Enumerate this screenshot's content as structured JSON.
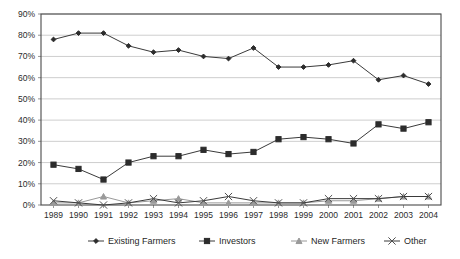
{
  "chart_data": {
    "type": "line",
    "title": "",
    "xlabel": "",
    "ylabel": "",
    "ylim": [
      0,
      90
    ],
    "ytick_labels": [
      "0%",
      "10%",
      "20%",
      "30%",
      "40%",
      "50%",
      "60%",
      "70%",
      "80%",
      "90%"
    ],
    "ytick_values": [
      0,
      10,
      20,
      30,
      40,
      50,
      60,
      70,
      80,
      90
    ],
    "grid": true,
    "legend_position": "bottom",
    "categories": [
      "1989",
      "1990",
      "1991",
      "1992",
      "1993",
      "1994",
      "1995",
      "1996",
      "1997",
      "1998",
      "1999",
      "2000",
      "2001",
      "2002",
      "2003",
      "2004"
    ],
    "series": [
      {
        "name": "Existing Farmers",
        "marker": "diamond",
        "values": [
          78,
          81,
          81,
          75,
          72,
          73,
          70,
          69,
          74,
          65,
          65,
          66,
          68,
          59,
          61,
          57
        ]
      },
      {
        "name": "Investors",
        "marker": "square",
        "values": [
          19,
          17,
          12,
          20,
          23,
          23,
          26,
          24,
          25,
          31,
          32,
          31,
          29,
          38,
          36,
          39
        ]
      },
      {
        "name": "New Farmers",
        "marker": "triangle",
        "values": [
          1,
          1,
          4,
          1,
          2,
          3,
          1,
          1,
          1,
          1,
          1,
          2,
          2,
          3,
          4,
          4
        ]
      },
      {
        "name": "Other",
        "marker": "cross",
        "values": [
          2,
          1,
          0,
          1,
          3,
          1,
          2,
          4,
          2,
          1,
          1,
          3,
          3,
          3,
          4,
          4
        ]
      }
    ],
    "colors": {
      "existing_farmers": "#2c2c2c",
      "investors": "#2c2c2c",
      "new_farmers": "#9a9a9a",
      "other": "#4f4f4f",
      "gridline": "#b9b9b9",
      "frame": "#4a4a4a",
      "background": "#ffffff"
    }
  },
  "legend": {
    "items": [
      {
        "label": "Existing Farmers"
      },
      {
        "label": "Investors"
      },
      {
        "label": "New Farmers"
      },
      {
        "label": "Other"
      }
    ]
  }
}
